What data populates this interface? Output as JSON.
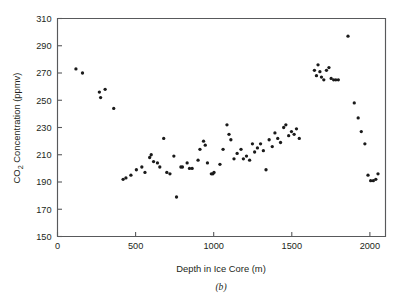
{
  "figure": {
    "caption": "(b)",
    "background": "#ffffff",
    "marker_color": "#1a1a1a",
    "axis_color": "#58595b"
  },
  "chart_data": {
    "type": "scatter",
    "title": "",
    "xlabel": "Depth in Ice Core (m)",
    "ylabel": "CO2 Concentration (ppmv)",
    "ylabel_parts": {
      "prefix": "CO",
      "subscript": "2",
      "suffix": " Concentration (ppmv)"
    },
    "xlim": [
      0,
      2100
    ],
    "ylim": [
      150,
      310
    ],
    "xticks": [
      0,
      500,
      1000,
      1500,
      2000
    ],
    "yticks": [
      150,
      170,
      190,
      210,
      230,
      250,
      270,
      290,
      310
    ],
    "grid": false,
    "legend": null,
    "marker": "dot",
    "series": [
      {
        "name": "Vostok ice core CO2",
        "points": [
          [
            118,
            273
          ],
          [
            160,
            270
          ],
          [
            268,
            256
          ],
          [
            276,
            252
          ],
          [
            305,
            258
          ],
          [
            360,
            244
          ],
          [
            420,
            192
          ],
          [
            438,
            193
          ],
          [
            470,
            195
          ],
          [
            505,
            199
          ],
          [
            540,
            201
          ],
          [
            560,
            197
          ],
          [
            590,
            208
          ],
          [
            600,
            210
          ],
          [
            615,
            205
          ],
          [
            640,
            204
          ],
          [
            655,
            201
          ],
          [
            680,
            222
          ],
          [
            700,
            197
          ],
          [
            720,
            196
          ],
          [
            745,
            209
          ],
          [
            762,
            179
          ],
          [
            790,
            201
          ],
          [
            800,
            201
          ],
          [
            830,
            204
          ],
          [
            845,
            200
          ],
          [
            862,
            200
          ],
          [
            900,
            206
          ],
          [
            912,
            214
          ],
          [
            935,
            220
          ],
          [
            946,
            217
          ],
          [
            960,
            204
          ],
          [
            985,
            196
          ],
          [
            995,
            196
          ],
          [
            1002,
            197
          ],
          [
            1040,
            203
          ],
          [
            1060,
            214
          ],
          [
            1085,
            232
          ],
          [
            1098,
            225
          ],
          [
            1110,
            221
          ],
          [
            1130,
            207
          ],
          [
            1150,
            211
          ],
          [
            1175,
            214
          ],
          [
            1190,
            207
          ],
          [
            1210,
            209
          ],
          [
            1230,
            206
          ],
          [
            1248,
            218
          ],
          [
            1262,
            212
          ],
          [
            1280,
            215
          ],
          [
            1300,
            218
          ],
          [
            1318,
            213
          ],
          [
            1335,
            199
          ],
          [
            1355,
            221
          ],
          [
            1375,
            216
          ],
          [
            1392,
            226
          ],
          [
            1410,
            222
          ],
          [
            1428,
            219
          ],
          [
            1448,
            230
          ],
          [
            1462,
            232
          ],
          [
            1480,
            224
          ],
          [
            1498,
            227
          ],
          [
            1515,
            225
          ],
          [
            1530,
            229
          ],
          [
            1548,
            222
          ],
          [
            1645,
            272
          ],
          [
            1658,
            268
          ],
          [
            1668,
            276
          ],
          [
            1680,
            271
          ],
          [
            1690,
            267
          ],
          [
            1705,
            265
          ],
          [
            1722,
            272
          ],
          [
            1738,
            274
          ],
          [
            1752,
            266
          ],
          [
            1768,
            265
          ],
          [
            1782,
            265
          ],
          [
            1798,
            265
          ],
          [
            1860,
            297
          ],
          [
            1900,
            248
          ],
          [
            1925,
            237
          ],
          [
            1945,
            227
          ],
          [
            1968,
            218
          ],
          [
            1988,
            195
          ],
          [
            2005,
            191
          ],
          [
            2022,
            191
          ],
          [
            2038,
            192
          ],
          [
            2052,
            196
          ]
        ]
      }
    ]
  }
}
